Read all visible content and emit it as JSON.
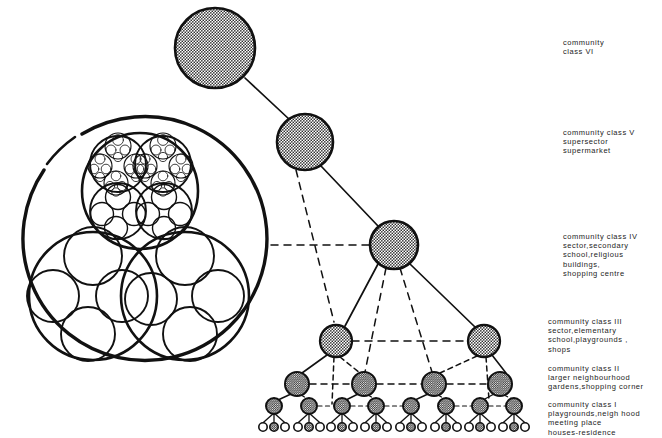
{
  "figure": {
    "stroke_color": "#111111",
    "node_fill": "#9a9a9a",
    "background": "#ffffff"
  },
  "labels": [
    {
      "id": "label-class-vi",
      "x": 563,
      "y": 38,
      "text": "community\nclass VI"
    },
    {
      "id": "label-class-v",
      "x": 563,
      "y": 128,
      "text": "community class V\nsupersector\nsupermarket"
    },
    {
      "id": "label-class-iv",
      "x": 563,
      "y": 232,
      "text": "community class IV\nsector,secondary\nschool,religious\nbuildings,\nshopping centre"
    },
    {
      "id": "label-class-iii",
      "x": 548,
      "y": 317,
      "text": "community class III\nsector,elementary\nschool,playgrounds ,\nshops"
    },
    {
      "id": "label-class-ii",
      "x": 548,
      "y": 364,
      "text": "community class II\nlarger neighbourhood\ngardens,shopping corner"
    },
    {
      "id": "label-class-i",
      "x": 548,
      "y": 400,
      "text": "community class I\nplaygrounds,neigh hood\nmeeting place\nhouses-residence"
    }
  ],
  "tree": {
    "nodes": [
      {
        "id": "class-vi-node",
        "class": "VI",
        "x": 215,
        "y": 48,
        "r": 40
      },
      {
        "id": "class-v-node",
        "class": "V",
        "x": 305,
        "y": 142,
        "r": 28
      },
      {
        "id": "class-iv-node",
        "class": "IV",
        "x": 394,
        "y": 245,
        "r": 24
      },
      {
        "id": "class-iii-node-left",
        "class": "III",
        "x": 336,
        "y": 341,
        "r": 16
      },
      {
        "id": "class-iii-node-right",
        "class": "III",
        "x": 484,
        "y": 341,
        "r": 16
      },
      {
        "id": "class-ii-node-1",
        "class": "II",
        "x": 297,
        "y": 384,
        "r": 12
      },
      {
        "id": "class-ii-node-2",
        "class": "II",
        "x": 364,
        "y": 384,
        "r": 12
      },
      {
        "id": "class-ii-node-3",
        "class": "II",
        "x": 434,
        "y": 384,
        "r": 12
      },
      {
        "id": "class-ii-node-4",
        "class": "II",
        "x": 500,
        "y": 384,
        "r": 12
      },
      {
        "id": "class-i-node-1",
        "class": "I",
        "x": 274,
        "y": 406,
        "r": 8
      },
      {
        "id": "class-i-node-2",
        "class": "I",
        "x": 309,
        "y": 406,
        "r": 8
      },
      {
        "id": "class-i-node-3",
        "class": "I",
        "x": 342,
        "y": 406,
        "r": 8
      },
      {
        "id": "class-i-node-4",
        "class": "I",
        "x": 376,
        "y": 406,
        "r": 8
      },
      {
        "id": "class-i-node-5",
        "class": "I",
        "x": 411,
        "y": 406,
        "r": 8
      },
      {
        "id": "class-i-node-6",
        "class": "I",
        "x": 446,
        "y": 406,
        "r": 8
      },
      {
        "id": "class-i-node-7",
        "class": "I",
        "x": 480,
        "y": 406,
        "r": 8
      },
      {
        "id": "class-i-node-8",
        "class": "I",
        "x": 514,
        "y": 406,
        "r": 8
      }
    ],
    "house_row": {
      "count_per_parent": 3,
      "y": 427,
      "r": 4.2,
      "spacing": 11
    },
    "counts": {
      "class_vi": 1,
      "class_v": 1,
      "class_iv": 1,
      "class_iii": 2,
      "class_ii": 4,
      "class_i": 8,
      "houses": 24
    },
    "link_styles": {
      "solid": "outer structural links",
      "dashed": "lateral and intermediate links"
    }
  },
  "cluster": {
    "id": "fractal-cluster-diagram",
    "center": {
      "x": 136,
      "y": 242
    },
    "outer_radius": 122,
    "sub_clusters": 3,
    "children_per_cluster": 4,
    "description": "Large circle containing three sub-circles; upper sub-circle subdivided to deeper fractal levels"
  }
}
